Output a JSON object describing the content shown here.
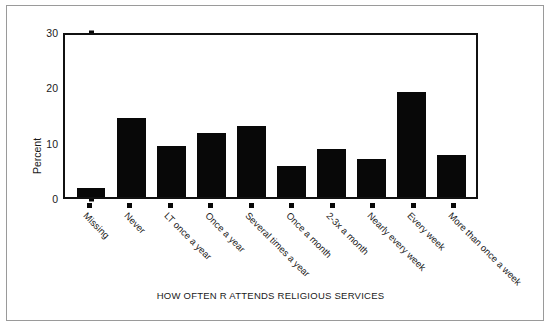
{
  "chart_data": {
    "type": "bar",
    "title": "",
    "xlabel": "HOW OFTEN R ATTENDS RELIGIOUS SERVICES",
    "ylabel": "Percent",
    "ylim": [
      0,
      30
    ],
    "yticks": [
      0,
      10,
      20,
      30
    ],
    "ytick_labels": [
      "0",
      "10",
      "20",
      "30"
    ],
    "grid": false,
    "legend": null,
    "bar_color": "#080808",
    "axis_color": "#111111",
    "categories": [
      "Missing",
      "Never",
      "LT once a year",
      "Once a year",
      "Several times a year",
      "Once a month",
      "2-3x a month",
      "Nearly every week",
      "Every week",
      "More than once a week"
    ],
    "values": [
      1.6,
      14.6,
      9.5,
      11.8,
      13.1,
      5.7,
      8.8,
      7.1,
      19.4,
      7.8
    ]
  },
  "figure": {
    "border_color": "#9a9a9a",
    "background": "#ffffff"
  }
}
